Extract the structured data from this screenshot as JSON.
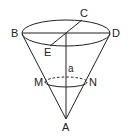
{
  "diagram": {
    "type": "geometry-cone",
    "labels": {
      "B": "B",
      "C": "C",
      "D": "D",
      "E": "E",
      "M": "M",
      "N": "N",
      "a": "a",
      "A": "A"
    },
    "colors": {
      "stroke": "#222222",
      "background": "#ffffff"
    }
  }
}
